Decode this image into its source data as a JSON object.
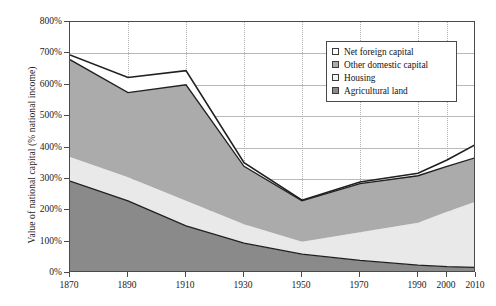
{
  "chart_data": {
    "type": "area",
    "stacked": true,
    "title": "",
    "subtitle": "",
    "xlabel": "",
    "ylabel": "Value of national capital (% national income)",
    "xlim": [
      1870,
      2010
    ],
    "ylim": [
      0,
      800
    ],
    "ytick_labels": [
      "0%",
      "100%",
      "200%",
      "300%",
      "400%",
      "500%",
      "600%",
      "700%",
      "800%"
    ],
    "ytick_values": [
      0,
      100,
      200,
      300,
      400,
      500,
      600,
      700,
      800
    ],
    "xtick_labels": [
      "1870",
      "1890",
      "1910",
      "1930",
      "1950",
      "1970",
      "1990",
      "2000",
      "2010"
    ],
    "xtick_values": [
      1870,
      1890,
      1910,
      1930,
      1950,
      1970,
      1990,
      2000,
      2010
    ],
    "grid": "horizontal-solid-and-vertical-dotted",
    "legend_position": "top-right-inside",
    "x": [
      1870,
      1890,
      1910,
      1930,
      1950,
      1970,
      1990,
      2000,
      2010
    ],
    "series": [
      {
        "name": "Agricultural land",
        "color": "#8a8a8a",
        "values": [
          293,
          230,
          150,
          95,
          60,
          40,
          25,
          20,
          18
        ]
      },
      {
        "name": "Housing",
        "color": "#e9e9e9",
        "values": [
          77,
          75,
          80,
          60,
          40,
          90,
          135,
          175,
          210
        ]
      },
      {
        "name": "Other domestic capital",
        "color": "#ababab",
        "values": [
          310,
          270,
          370,
          185,
          130,
          155,
          150,
          145,
          140
        ]
      },
      {
        "name": "Net foreign capital",
        "color": "#ffffff",
        "values": [
          15,
          48,
          45,
          12,
          2,
          5,
          8,
          20,
          42
        ]
      }
    ],
    "cumulative_totals": [
      695,
      623,
      645,
      352,
      232,
      290,
      318,
      360,
      410
    ]
  },
  "legend": {
    "items": [
      {
        "label": "Net foreign capital",
        "swatch": "white"
      },
      {
        "label": "Other domestic capital",
        "swatch": "medium-grey"
      },
      {
        "label": "Housing",
        "swatch": "light-grey"
      },
      {
        "label": "Agricultural land",
        "swatch": "dark-grey"
      }
    ]
  },
  "colors": {
    "agricultural_land": "#8a8a8a",
    "housing": "#e9e9e9",
    "other_domestic_capital": "#ababab",
    "net_foreign_capital": "#ffffff",
    "axis": "#4a4a4a",
    "gridline": "#b9b9b9",
    "line": "#1f1f1f"
  }
}
